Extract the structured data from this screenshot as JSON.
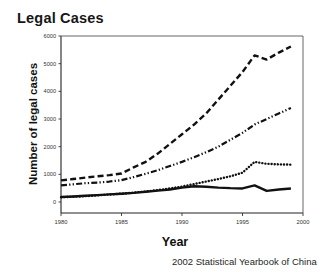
{
  "figure": {
    "title": "Legal Cases",
    "source_caption": "2002 Statistical Yearbook of China"
  },
  "chart_data": {
    "type": "line",
    "title": "Legal Cases",
    "xlabel": "Year",
    "ylabel": "Number of legal cases",
    "xlim": [
      1980,
      2000
    ],
    "ylim": [
      0,
      6000
    ],
    "grid": false,
    "legend": "none",
    "xticks": [
      "1980",
      "1985",
      "1990",
      "1995",
      "2000"
    ],
    "yticks": [
      "0",
      "1000",
      "2000",
      "3000",
      "4000",
      "5000",
      "6000"
    ],
    "x": [
      1980,
      1981,
      1982,
      1983,
      1984,
      1985,
      1986,
      1987,
      1988,
      1989,
      1990,
      1991,
      1992,
      1993,
      1994,
      1995,
      1996,
      1997,
      1998,
      1999
    ],
    "series": [
      {
        "name": "series-dashed",
        "style": "dashed",
        "color": "#111111",
        "values": [
          780,
          830,
          880,
          930,
          970,
          1030,
          1250,
          1450,
          1750,
          2100,
          2450,
          2800,
          3200,
          3700,
          4200,
          4700,
          5300,
          5150,
          5400,
          5620
        ]
      },
      {
        "name": "series-dash-dot-dot",
        "style": "dash-dot-dot",
        "color": "#111111",
        "values": [
          600,
          640,
          680,
          700,
          740,
          790,
          900,
          1020,
          1150,
          1300,
          1450,
          1620,
          1800,
          2000,
          2250,
          2500,
          2800,
          3000,
          3200,
          3400
        ]
      },
      {
        "name": "series-dotted",
        "style": "dotted",
        "color": "#111111",
        "values": [
          170,
          190,
          210,
          240,
          270,
          300,
          340,
          380,
          430,
          490,
          560,
          650,
          740,
          830,
          930,
          1060,
          1450,
          1380,
          1360,
          1350
        ]
      },
      {
        "name": "series-solid",
        "style": "solid",
        "color": "#111111",
        "values": [
          180,
          200,
          225,
          250,
          275,
          300,
          330,
          370,
          410,
          450,
          520,
          570,
          550,
          520,
          500,
          490,
          600,
          400,
          450,
          490
        ]
      }
    ]
  }
}
